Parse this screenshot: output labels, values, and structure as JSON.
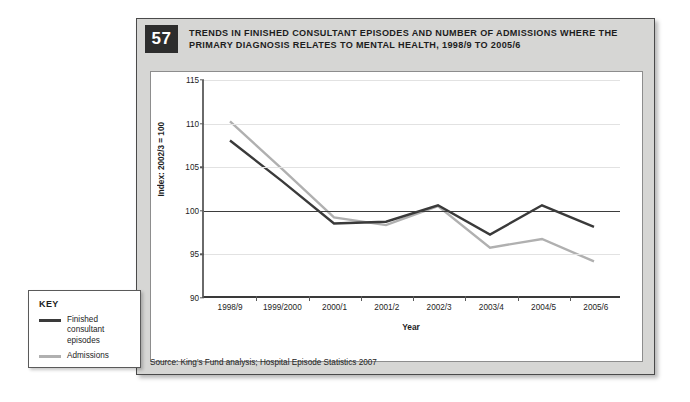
{
  "figure": {
    "number": "57",
    "title": "TRENDS IN FINISHED CONSULTANT EPISODES AND NUMBER OF ADMISSIONS WHERE THE PRIMARY DIAGNOSIS RELATES TO MENTAL HEALTH, 1998/9 TO 2005/6",
    "source": "Source: King's Fund analysis; Hospital Episode Statistics 2007"
  },
  "key": {
    "heading": "KEY",
    "items": [
      {
        "label": "Finished consultant episodes",
        "color": "#3a3a3a"
      },
      {
        "label": "Admissions",
        "color": "#b0b0b0"
      }
    ]
  },
  "chart_data": {
    "type": "line",
    "title": "TRENDS IN FINISHED CONSULTANT EPISODES AND NUMBER OF ADMISSIONS WHERE THE PRIMARY DIAGNOSIS RELATES TO MENTAL HEALTH, 1998/9 TO 2005/6",
    "xlabel": "Year",
    "ylabel": "Index: 2002/3 = 100",
    "categories": [
      "1998/9",
      "1999/2000",
      "2000/1",
      "2001/2",
      "2002/3",
      "2003/4",
      "2004/5",
      "2005/6"
    ],
    "ylim": [
      90,
      115
    ],
    "yticks": [
      90,
      95,
      100,
      105,
      110,
      115
    ],
    "grid": true,
    "baseline": 100,
    "legend_position": "outside-left",
    "series": [
      {
        "name": "Finished consultant episodes",
        "color": "#3a3a3a",
        "values": [
          108.0,
          103.3,
          98.4,
          98.6,
          100.5,
          97.1,
          100.5,
          98.0
        ]
      },
      {
        "name": "Admissions",
        "color": "#b0b0b0",
        "values": [
          110.2,
          104.7,
          99.1,
          98.2,
          100.4,
          95.6,
          96.6,
          94.0
        ]
      }
    ]
  }
}
